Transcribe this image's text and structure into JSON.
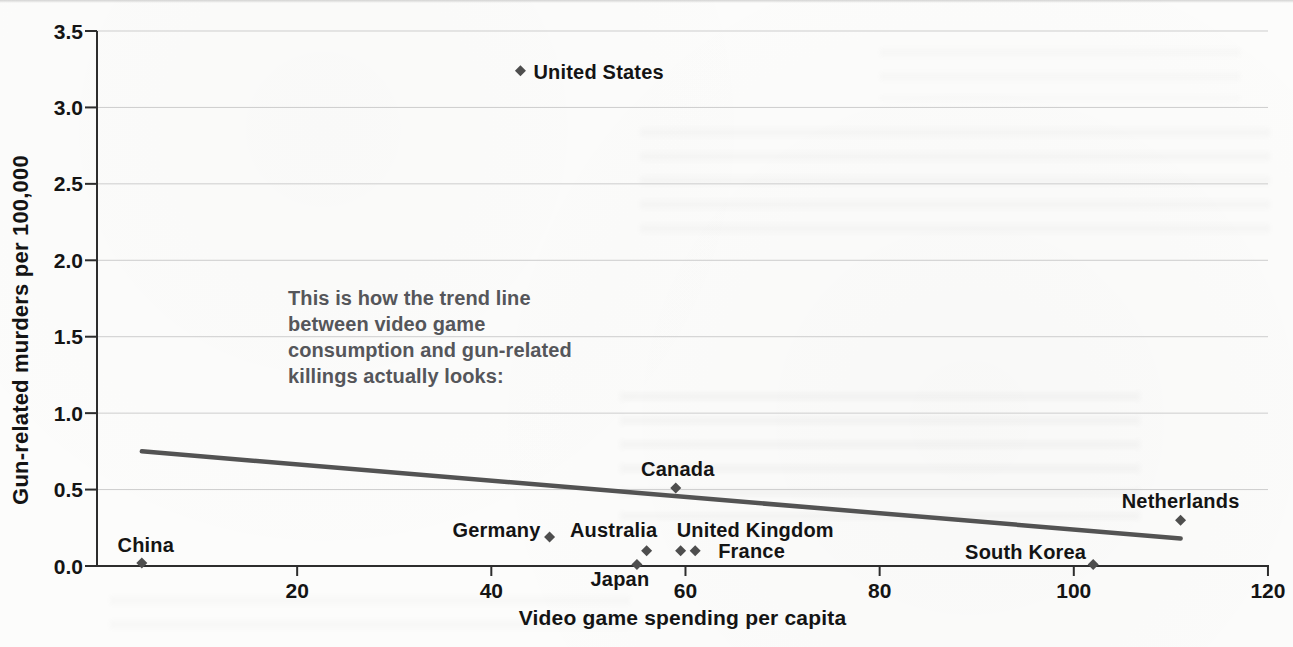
{
  "page": {
    "kind": "scanned textbook scatter plot",
    "background_color": "#fcfcfb"
  },
  "annotation": {
    "color": "#55565a",
    "lines": [
      "This is how the trend line",
      "between video game",
      "consumption and gun-related",
      "killings actually looks:"
    ]
  },
  "chart_data": {
    "type": "scatter",
    "title": "",
    "xlabel": "Video game spending per capita",
    "ylabel": "Gun-related murders per 100,000",
    "xlim": [
      0,
      120
    ],
    "ylim": [
      0,
      3.5
    ],
    "x_ticks": [
      "20",
      "40",
      "60",
      "80",
      "100",
      "120"
    ],
    "y_ticks": [
      "3.5",
      "3.0",
      "2.5",
      "2.0",
      "1.5",
      "1.0",
      "0.5",
      "0.0"
    ],
    "grid": "horizontal gridlines only",
    "legend": "none",
    "marker": "diamond",
    "colors": {
      "marker": "#4e4e4e",
      "trend_line": "#535353",
      "gridline": "#cdcdcd",
      "axis": "#2d2d2d",
      "tick_label": "#141414",
      "point_label": "#141414"
    },
    "trend_line": {
      "x1": 4,
      "y1": 0.75,
      "x2": 111,
      "y2": 0.18
    },
    "points": [
      {
        "label": "China",
        "x": 4,
        "y": 0.02,
        "label_anchor": "middle",
        "label_dx": 4,
        "label_dy": -18
      },
      {
        "label": "United States",
        "x": 43,
        "y": 3.24,
        "label_anchor": "start",
        "label_dx": 13,
        "label_dy": 1
      },
      {
        "label": "Germany",
        "x": 46,
        "y": 0.19,
        "label_anchor": "end",
        "label_dx": -9,
        "label_dy": -7
      },
      {
        "label": "Japan",
        "x": 55,
        "y": 0.01,
        "label_anchor": "middle",
        "label_dx": -17,
        "label_dy": 15
      },
      {
        "label": "Australia",
        "x": 56,
        "y": 0.1,
        "label_anchor": "middle",
        "label_dx": -33,
        "label_dy": -21
      },
      {
        "label": "Canada",
        "x": 59,
        "y": 0.51,
        "label_anchor": "middle",
        "label_dx": 2,
        "label_dy": -19
      },
      {
        "label": "United Kingdom",
        "x": 59.5,
        "y": 0.1,
        "label_anchor": "start",
        "label_dx": -4,
        "label_dy": -21
      },
      {
        "label": "France",
        "x": 61,
        "y": 0.1,
        "label_anchor": "start",
        "label_dx": 23,
        "label_dy": 0
      },
      {
        "label": "South Korea",
        "x": 102,
        "y": 0.01,
        "label_anchor": "end",
        "label_dx": -7,
        "label_dy": -12
      },
      {
        "label": "Netherlands",
        "x": 111,
        "y": 0.3,
        "label_anchor": "middle",
        "label_dx": 0,
        "label_dy": -19
      }
    ]
  }
}
